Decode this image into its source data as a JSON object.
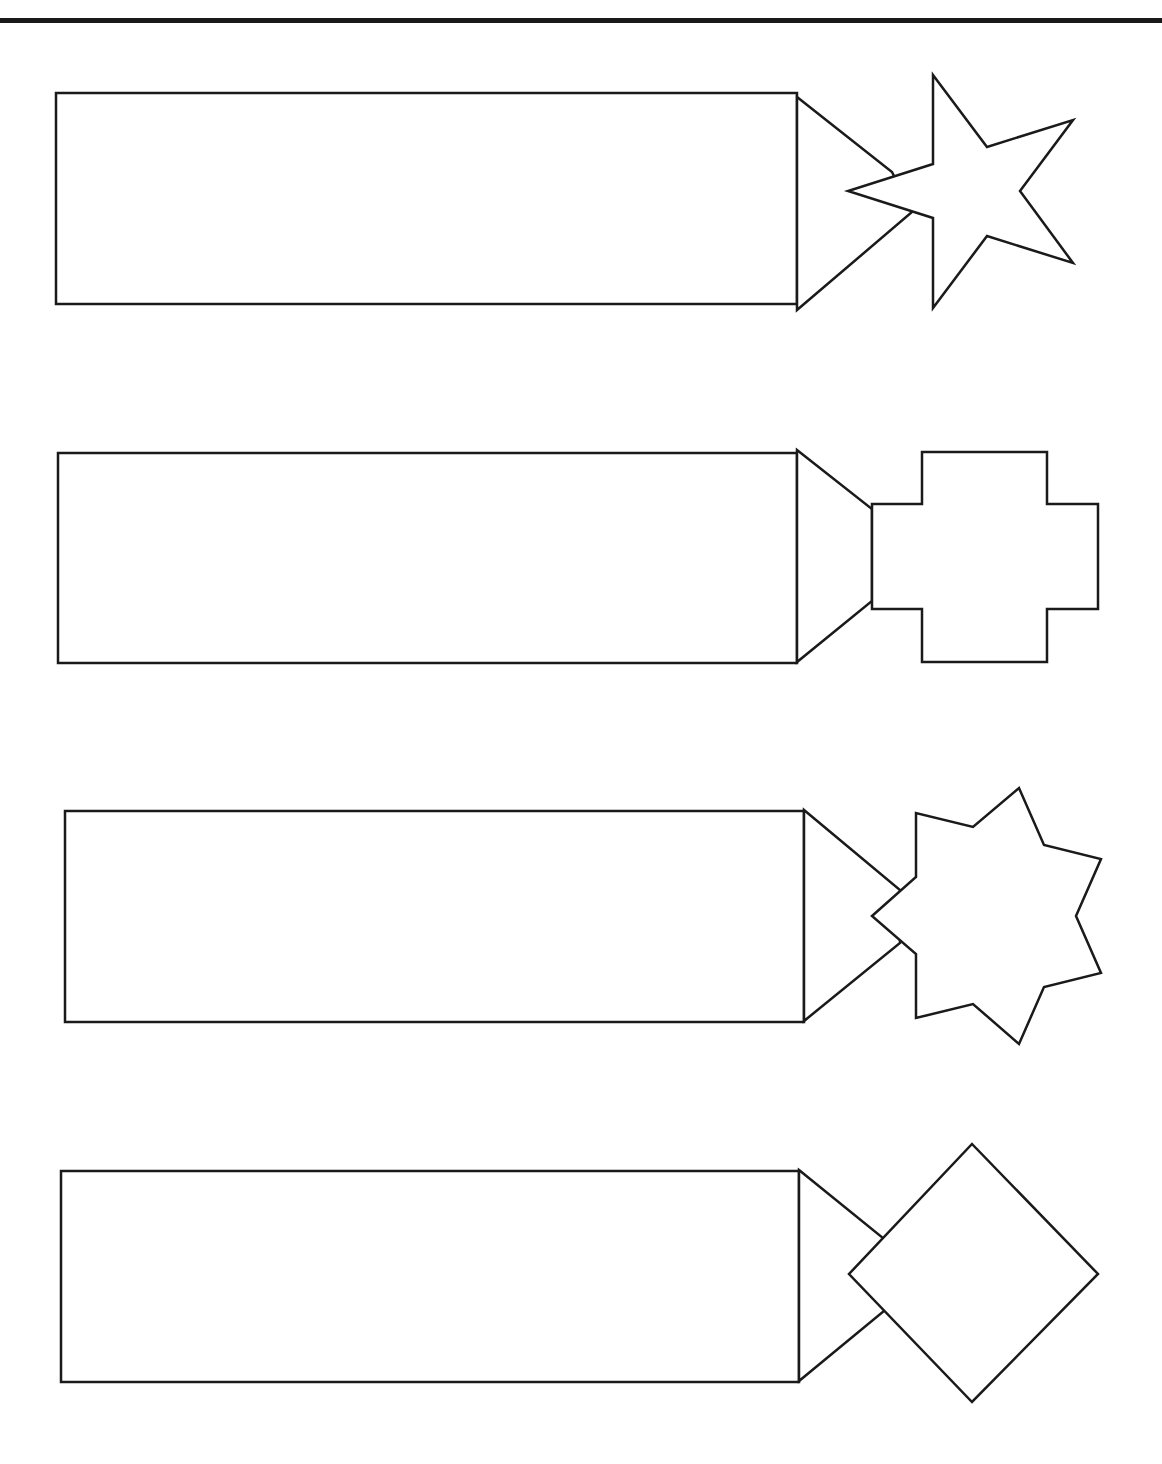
{
  "page": {
    "width": 1162,
    "height": 1464,
    "background": "#ffffff",
    "stroke_color": "#1a1a1a"
  },
  "worksheet": {
    "rows": [
      {
        "name": "star-five-point",
        "rect": {
          "x": 56,
          "y": 93,
          "w": 741,
          "h": 211
        },
        "tip_points": "797,97 892,172 912,212 797,310",
        "shape_points": "933,75 987,147 1073,120 1020,191 1073,263 987,236 933,308 933,218 848,191 933,164"
      },
      {
        "name": "cross",
        "rect": {
          "x": 58,
          "y": 453,
          "w": 739,
          "h": 210
        },
        "tip_points": "797,450 872,509 872,601 797,662",
        "shape_points": "922,452 1047,452 1047,504 1098,504 1098,609 1047,609 1047,662 922,662 922,609 872,609 872,504 922,504"
      },
      {
        "name": "star-seven-point",
        "rect": {
          "x": 65,
          "y": 811,
          "w": 739,
          "h": 211
        },
        "tip_points": "804,810 900,890 900,943 804,1021",
        "shape_points": "872,916 916,877 916,813 973,827 1019,788 1044,845 1101,859 1076,916 1101,973 1044,987 1019,1044 973,1004 916,1018 916,954"
      },
      {
        "name": "diamond",
        "rect": {
          "x": 61,
          "y": 1171,
          "w": 738,
          "h": 211
        },
        "tip_points": "799,1170 883,1238 884,1311 799,1381",
        "shape_points": "972,1144 1098,1274 972,1402 849,1274"
      }
    ]
  }
}
